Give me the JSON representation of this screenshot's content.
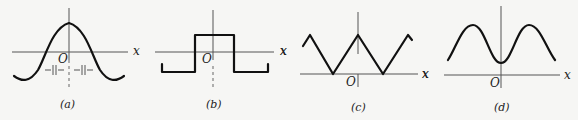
{
  "figure": {
    "panels": [
      {
        "id": "a",
        "caption": "(a)",
        "origin_label": "O",
        "x_axis_label": "x",
        "markers": "—||—.—||—",
        "shape": "cosine-like (peak at origin)"
      },
      {
        "id": "b",
        "caption": "(b)",
        "origin_label": "O",
        "x_axis_label": "x",
        "shape": "rectangular pulse centered at origin"
      },
      {
        "id": "c",
        "caption": "(c)",
        "origin_label": "O",
        "x_axis_label": "x",
        "y_side_label": "x",
        "shape": "triangular wave (peak at origin)"
      },
      {
        "id": "d",
        "caption": "(d)",
        "origin_label": "O",
        "x_axis_label": "x",
        "y_side_label": "x",
        "shape": "inverted cosine (minimum at origin, above axis)"
      }
    ]
  }
}
